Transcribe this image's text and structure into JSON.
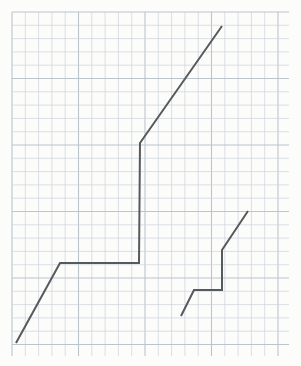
{
  "page": {
    "title": "Graph paper polyline diagram",
    "width": 301,
    "height": 366,
    "background_color": "#fcfcfb"
  },
  "grid": {
    "name": "graph-paper-grid",
    "line_color": "#cdd3db",
    "major_line_color": "#bcc4ce",
    "cell_size": 13.3,
    "major_every": 5,
    "origin_x": 12,
    "origin_y": 12,
    "extent_x": 289,
    "extent_y": 356,
    "columns": 21,
    "rows": 26
  },
  "chart_data": {
    "type": "line",
    "title": "",
    "subtitle": "",
    "xlabel": "",
    "ylabel": "",
    "grid": true,
    "legend_position": "none",
    "xlim": [
      12,
      289
    ],
    "ylim": [
      12,
      356
    ],
    "annotations": [],
    "tick_labels": {
      "x": [],
      "y": []
    },
    "series": [
      {
        "name": "polyline-main",
        "color": "#555a5f",
        "stroke_width": 2,
        "points": [
          [
            16,
            343
          ],
          [
            60,
            263
          ],
          [
            139,
            263
          ],
          [
            140,
            143
          ],
          [
            222,
            26
          ]
        ]
      },
      {
        "name": "polyline-secondary",
        "color": "#555a5f",
        "stroke_width": 2,
        "points": [
          [
            181,
            316
          ],
          [
            194,
            290
          ],
          [
            222,
            290
          ],
          [
            222,
            250
          ],
          [
            248,
            211
          ]
        ]
      }
    ]
  }
}
